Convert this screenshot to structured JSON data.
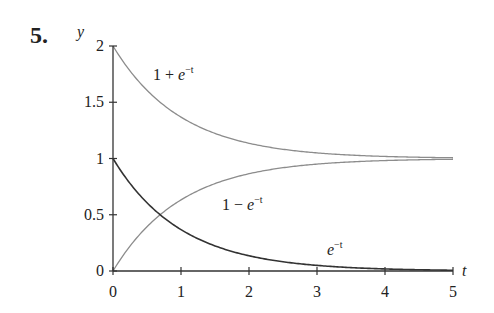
{
  "problem": {
    "number": "5."
  },
  "chart_data": {
    "type": "line",
    "title": "",
    "xlabel": "t",
    "ylabel": "y",
    "xlim": [
      0,
      5
    ],
    "ylim": [
      0,
      2
    ],
    "xticks": [
      0,
      1,
      2,
      3,
      4,
      5
    ],
    "xtick_labels": [
      "0",
      "1",
      "2",
      "3",
      "4",
      "5"
    ],
    "yticks": [
      0,
      0.5,
      1,
      1.5,
      2
    ],
    "ytick_labels": [
      "0",
      "0.5",
      "1",
      "1.5",
      "2"
    ],
    "grid": false,
    "legend": "none (inline labels)",
    "series": [
      {
        "name": "1 + e^-t",
        "label_base": "1 + ",
        "label_var": "e",
        "label_sup": "−t",
        "color": "#8c8c8c",
        "x": [
          0,
          0.5,
          1,
          1.5,
          2,
          2.5,
          3,
          3.5,
          4,
          4.5,
          5
        ],
        "values": [
          2.0,
          1.607,
          1.368,
          1.223,
          1.135,
          1.082,
          1.05,
          1.03,
          1.018,
          1.011,
          1.007
        ]
      },
      {
        "name": "1 − e^-t",
        "label_base": "1 − ",
        "label_var": "e",
        "label_sup": "−t",
        "color": "#8c8c8c",
        "x": [
          0,
          0.5,
          1,
          1.5,
          2,
          2.5,
          3,
          3.5,
          4,
          4.5,
          5
        ],
        "values": [
          0.0,
          0.393,
          0.632,
          0.777,
          0.865,
          0.918,
          0.95,
          0.97,
          0.982,
          0.989,
          0.993
        ]
      },
      {
        "name": "e^-t",
        "label_base": "",
        "label_var": "e",
        "label_sup": "−t",
        "color": "#333333",
        "x": [
          0,
          0.5,
          1,
          1.5,
          2,
          2.5,
          3,
          3.5,
          4,
          4.5,
          5
        ],
        "values": [
          1.0,
          0.607,
          0.368,
          0.223,
          0.135,
          0.082,
          0.05,
          0.03,
          0.018,
          0.011,
          0.007
        ]
      }
    ]
  },
  "colors": {
    "axis": "#333333",
    "curve_light": "#8c8c8c",
    "curve_dark": "#333333"
  }
}
